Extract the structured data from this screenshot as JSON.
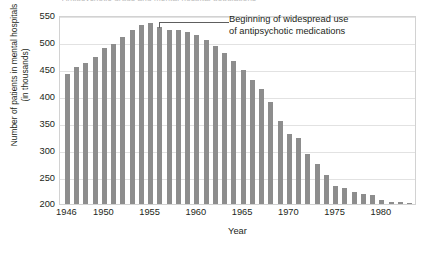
{
  "top_caption_remnant": "Antipsychotic drugs and mental hospital populations",
  "annotation": {
    "line1": "Beginning of widespread use",
    "line2": "of antipsychotic medications",
    "points_to_year": 1956
  },
  "axes": {
    "y_title_line1": "Number of patients in mental hospitals",
    "y_title_line2": "(in thousands)",
    "x_title": "Year",
    "y_ticks": [
      "200",
      "250",
      "300",
      "350",
      "400",
      "450",
      "500",
      "550"
    ],
    "x_ticks": [
      "1946",
      "1950",
      "1955",
      "1960",
      "1965",
      "1970",
      "1975",
      "1980"
    ]
  },
  "colors": {
    "bar": "#8d8d8d",
    "gridline": "#e2e2e2",
    "frame": "#d2d2d2",
    "text": "#231f20",
    "leader": "#5e5e5e"
  },
  "chart_data": {
    "type": "bar",
    "title": "Antipsychotic drugs and mental hospital populations",
    "xlabel": "Year",
    "ylabel": "Number of patients in mental hospitals (in thousands)",
    "xlim": [
      1945.2,
      1983.8
    ],
    "ylim": [
      200,
      550
    ],
    "yticks": [
      200,
      250,
      300,
      350,
      400,
      450,
      500,
      550
    ],
    "xticks": [
      1946,
      1950,
      1955,
      1960,
      1965,
      1970,
      1975,
      1980
    ],
    "grid": "horizontal",
    "legend": "none",
    "units": "thousands of patients",
    "annotations": [
      {
        "text": "Beginning of widespread use of antipsychotic medications",
        "year": 1956
      }
    ],
    "categories": [
      1946,
      1947,
      1948,
      1949,
      1950,
      1951,
      1952,
      1953,
      1954,
      1955,
      1956,
      1957,
      1958,
      1959,
      1960,
      1961,
      1962,
      1963,
      1964,
      1965,
      1966,
      1967,
      1968,
      1969,
      1970,
      1971,
      1972,
      1973,
      1974,
      1975,
      1976,
      1977,
      1978,
      1979,
      1980,
      1981,
      1982,
      1983
    ],
    "values": [
      441,
      453,
      462,
      473,
      488,
      496,
      510,
      522,
      531,
      535,
      528,
      523,
      522,
      519,
      513,
      503,
      492,
      480,
      465,
      448,
      429,
      413,
      389,
      354,
      329,
      322,
      292,
      275,
      254,
      233,
      229,
      222,
      219,
      217,
      207,
      204,
      203,
      201
    ]
  }
}
